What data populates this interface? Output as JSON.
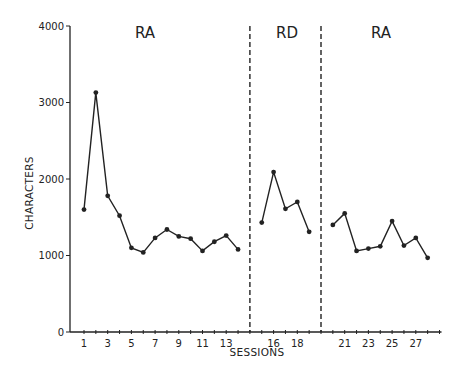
{
  "chart_data": {
    "type": "line",
    "title": "",
    "xlabel": "SESSIONS",
    "ylabel": "CHARACTERS",
    "ylim": [
      0,
      4000
    ],
    "yticks": [
      0,
      1000,
      2000,
      3000,
      4000
    ],
    "xtick_labels": [
      "1",
      "3",
      "5",
      "7",
      "9",
      "11",
      "13",
      "16",
      "18",
      "21",
      "23",
      "25",
      "27"
    ],
    "grid": false,
    "legend": null,
    "phases": [
      {
        "label": "RA",
        "sessions": [
          1,
          14
        ]
      },
      {
        "label": "RD",
        "sessions": [
          15,
          19
        ]
      },
      {
        "label": "RA",
        "sessions": [
          20,
          28
        ]
      }
    ],
    "phase_change_lines_after_sessions": [
      14,
      19
    ],
    "series": [
      {
        "name": "RA (baseline)",
        "x": [
          1,
          2,
          3,
          4,
          5,
          6,
          7,
          8,
          9,
          10,
          11,
          12,
          13,
          14
        ],
        "values": [
          1600,
          3130,
          1780,
          1520,
          1100,
          1040,
          1230,
          1340,
          1250,
          1220,
          1060,
          1180,
          1260,
          1080
        ]
      },
      {
        "name": "RD",
        "x": [
          15,
          16,
          17,
          18,
          19
        ],
        "values": [
          1430,
          2090,
          1610,
          1700,
          1310
        ]
      },
      {
        "name": "RA (return)",
        "x": [
          20,
          21,
          22,
          23,
          24,
          25,
          26,
          27,
          28
        ],
        "values": [
          1400,
          1550,
          1060,
          1090,
          1120,
          1450,
          1130,
          1230,
          970
        ]
      }
    ]
  },
  "labels": {
    "phase1": "RA",
    "phase2": "RD",
    "phase3": "RA",
    "xlabel": "SESSIONS",
    "ylabel": "CHARACTERS"
  }
}
